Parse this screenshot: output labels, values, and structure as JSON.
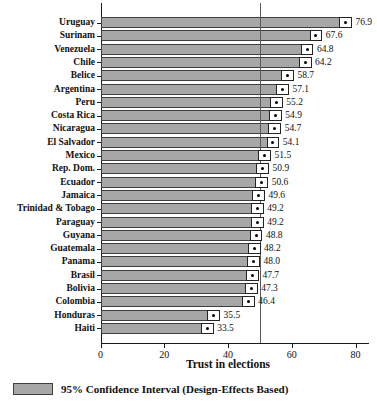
{
  "chart_data": {
    "type": "bar",
    "orientation": "horizontal",
    "title": "",
    "xlabel": "Trust in elections",
    "x_ticks": [
      0,
      20,
      40,
      60,
      80
    ],
    "xlim": [
      0,
      84
    ],
    "reference_line_x": 50,
    "grid": false,
    "categories": [
      "Uruguay",
      "Surinam",
      "Venezuela",
      "Chile",
      "Belice",
      "Argentina",
      "Peru",
      "Costa Rica",
      "Nicaragua",
      "El Salvador",
      "Mexico",
      "Rep. Dom.",
      "Ecuador",
      "Jamaica",
      "Trinidad & Tobago",
      "Paraguay",
      "Guyana",
      "Guatemala",
      "Panama",
      "Brasil",
      "Bolivia",
      "Colombia",
      "Honduras",
      "Haiti"
    ],
    "values": [
      76.9,
      67.6,
      64.8,
      64.2,
      58.7,
      57.1,
      55.2,
      54.9,
      54.7,
      54.1,
      51.5,
      50.9,
      50.6,
      49.6,
      49.2,
      49.2,
      48.8,
      48.2,
      48.0,
      47.7,
      47.3,
      46.4,
      35.5,
      33.5
    ],
    "ci_half_width": 2.0,
    "value_label_decimals": 1,
    "legend": {
      "label": "95% Confidence Interval (Design-Effects Based)",
      "position": "bottom-left"
    },
    "colors": {
      "bar_fill": "#a7a7a7",
      "bar_border": "#3f3f3f",
      "ci_fill": "#ffffff",
      "ci_border": "#242424",
      "dot": "#000000",
      "axis": "#1a1a1a",
      "reference_line": "#5a5a5a",
      "text": "#111111",
      "background": "#ffffff"
    }
  }
}
